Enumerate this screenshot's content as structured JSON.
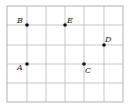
{
  "diagram": {
    "type": "coordinate-grid",
    "columns": 6,
    "rows": 5,
    "grid_color": "#b8b8b8",
    "point_color": "#111111",
    "points": [
      {
        "label": "B",
        "col": 1,
        "row": 1
      },
      {
        "label": "E",
        "col": 3,
        "row": 1
      },
      {
        "label": "D",
        "col": 5,
        "row": 2
      },
      {
        "label": "A",
        "col": 1,
        "row": 3
      },
      {
        "label": "C",
        "col": 4,
        "row": 3
      }
    ]
  }
}
